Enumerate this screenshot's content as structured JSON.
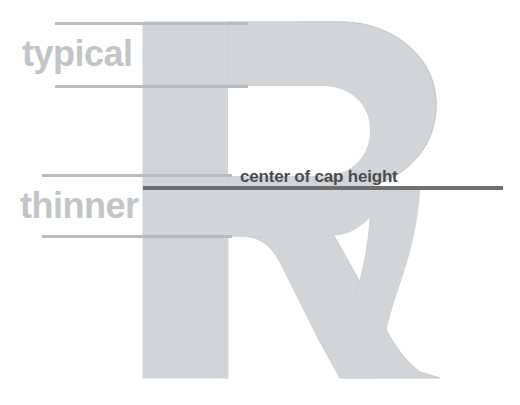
{
  "diagram": {
    "title": "center of cap height",
    "glyph": {
      "letter": "R",
      "fill_color": "#d2d5d7",
      "stroke_color": "#c8cbcd"
    },
    "colors": {
      "background": "#ffffff",
      "glyph_fill": "#d2d5d7",
      "measure_line": "#b9bcbe",
      "axis_line": "#6d6f71",
      "label_light": "#c2c5c7",
      "label_dark": "#4a4c4e"
    },
    "labels": {
      "typical": "typical",
      "thinner": "thinner",
      "center_of_cap_height": "center of cap height"
    },
    "measure_lines": [
      {
        "name": "top-stroke-upper-bound",
        "y": 22
      },
      {
        "name": "top-stroke-lower-bound",
        "y": 85
      },
      {
        "name": "bottom-stroke-upper-bound",
        "y": 174
      },
      {
        "name": "bottom-stroke-lower-bound",
        "y": 235
      }
    ],
    "axis": {
      "name": "cap-height-center-axis",
      "y": 188
    }
  }
}
